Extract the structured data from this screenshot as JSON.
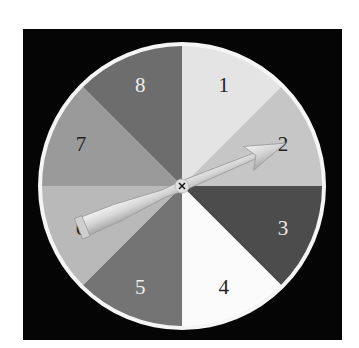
{
  "spinner": {
    "center": [
      182,
      186
    ],
    "radius": 140,
    "rim_radius": 143,
    "rim_color": "#f5f5f5",
    "background_color": "#050505",
    "segments": [
      {
        "label": "1",
        "color": "#e4e4e4",
        "text_color": "#222222"
      },
      {
        "label": "2",
        "color": "#c6c6c6",
        "text_color": "#222222"
      },
      {
        "label": "3",
        "color": "#4c4c4c",
        "text_color": "#e8e8e8"
      },
      {
        "label": "4",
        "color": "#fbfbfb",
        "text_color": "#222222"
      },
      {
        "label": "5",
        "color": "#747474",
        "text_color": "#eeeeee"
      },
      {
        "label": "6",
        "color": "#b9b9b9",
        "text_color": "#222222"
      },
      {
        "label": "7",
        "color": "#9a9a9a",
        "text_color": "#222222"
      },
      {
        "label": "8",
        "color": "#6d6d6d",
        "text_color": "#eeeeee"
      }
    ],
    "arrow": {
      "points_to": "2",
      "color": "#dcdcdc"
    }
  }
}
